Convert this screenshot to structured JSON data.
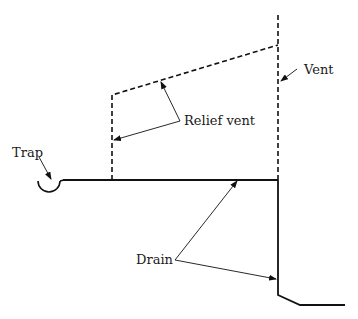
{
  "diagram": {
    "type": "plumbing-vent-schematic",
    "labels": {
      "trap": "Trap",
      "vent": "Vent",
      "relief_vent": "Relief vent",
      "drain": "Drain"
    },
    "colors": {
      "line": "#111111",
      "text": "#1a1a1a",
      "background": "#ffffff"
    },
    "elements": [
      {
        "name": "trap",
        "style": "solid",
        "shape": "semicircle"
      },
      {
        "name": "drain",
        "style": "solid",
        "shape": "polyline"
      },
      {
        "name": "vent",
        "style": "dashed",
        "shape": "vertical-line"
      },
      {
        "name": "relief-vent",
        "style": "dashed",
        "shape": "polyline"
      }
    ]
  }
}
